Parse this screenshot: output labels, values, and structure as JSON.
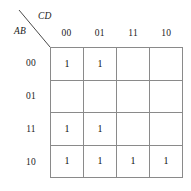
{
  "figure": {
    "type": "karnaugh-map",
    "row_axis_label": "AB",
    "column_axis_label": "CD",
    "column_headers": [
      "00",
      "01",
      "11",
      "10"
    ],
    "row_headers": [
      "00",
      "01",
      "11",
      "10"
    ],
    "grid_line_color": "#8a8a8a",
    "text_color": "#111111",
    "background_color": "#ffffff",
    "cells": [
      [
        "1",
        "1",
        "",
        ""
      ],
      [
        "",
        "",
        "",
        ""
      ],
      [
        "1",
        "1",
        "",
        ""
      ],
      [
        "1",
        "1",
        "1",
        "1"
      ]
    ]
  }
}
